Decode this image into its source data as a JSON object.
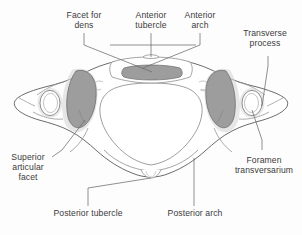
{
  "figure": {
    "colors": {
      "background": "#fdfdfd",
      "outline": "#5a5a5a",
      "inner_line": "#8e8e8e",
      "facet_fill": "#9d9d9d",
      "facet_edge": "#6d6d6d",
      "halo_fill": "#d6d6d6",
      "bone_fill": "#ffffff",
      "text": "#3b3b3b",
      "leader": "#6b6b6b"
    }
  },
  "labels": [
    {
      "id": "facet-for-dens",
      "line1": "Facet for",
      "line2": "dens"
    },
    {
      "id": "anterior-tubercle",
      "line1": "Anterior",
      "line2": "tubercle"
    },
    {
      "id": "anterior-arch",
      "line1": "Anterior",
      "line2": "arch"
    },
    {
      "id": "transverse-process",
      "line1": "Transverse",
      "line2": "process"
    },
    {
      "id": "superior-articular-facet",
      "line1": "Superior",
      "line2": "articular",
      "line3": "facet"
    },
    {
      "id": "foramen-transversarium",
      "line1": "Foramen",
      "line2": "transversarium"
    },
    {
      "id": "posterior-tubercle",
      "line1": "Posterior tubercle"
    },
    {
      "id": "posterior-arch",
      "line1": "Posterior arch"
    }
  ]
}
